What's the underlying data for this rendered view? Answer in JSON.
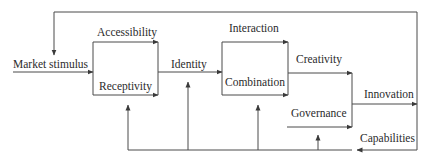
{
  "diagram": {
    "type": "flow",
    "line_color": "#3a3a3a",
    "text_color": "#2b2b2b",
    "background": "#ffffff",
    "labels": {
      "market_stimulus": "Market stimulus",
      "accessibility": "Accessibility",
      "receptivity": "Receptivity",
      "identity": "Identity",
      "interaction": "Interaction",
      "combination": "Combination",
      "creativity": "Creativity",
      "governance": "Governance",
      "innovation": "Innovation",
      "capabilities": "Capabilities"
    },
    "nodes": [
      {
        "id": "market_stimulus",
        "label": "Market stimulus"
      },
      {
        "id": "accessibility",
        "label": "Accessibility"
      },
      {
        "id": "receptivity",
        "label": "Receptivity"
      },
      {
        "id": "identity",
        "label": "Identity"
      },
      {
        "id": "interaction",
        "label": "Interaction"
      },
      {
        "id": "combination",
        "label": "Combination"
      },
      {
        "id": "creativity",
        "label": "Creativity"
      },
      {
        "id": "governance",
        "label": "Governance"
      },
      {
        "id": "innovation",
        "label": "Innovation"
      },
      {
        "id": "capabilities",
        "label": "Capabilities"
      }
    ],
    "edges": [
      {
        "from": "market_stimulus",
        "to": "accessibility/receptivity"
      },
      {
        "from": "accessibility/receptivity",
        "to": "identity"
      },
      {
        "from": "identity",
        "to": "interaction/combination"
      },
      {
        "from": "interaction/combination",
        "to": "creativity"
      },
      {
        "from": "creativity",
        "to": "innovation"
      },
      {
        "from": "governance",
        "to": "innovation"
      },
      {
        "from": "innovation",
        "to": "market_stimulus",
        "note": "top feedback loop"
      },
      {
        "from": "innovation",
        "to": "capabilities",
        "note": "bottom feedback loop"
      },
      {
        "from": "capabilities",
        "to": "accessibility/receptivity"
      },
      {
        "from": "capabilities",
        "to": "identity"
      },
      {
        "from": "capabilities",
        "to": "interaction/combination"
      },
      {
        "from": "capabilities",
        "to": "governance"
      }
    ]
  }
}
